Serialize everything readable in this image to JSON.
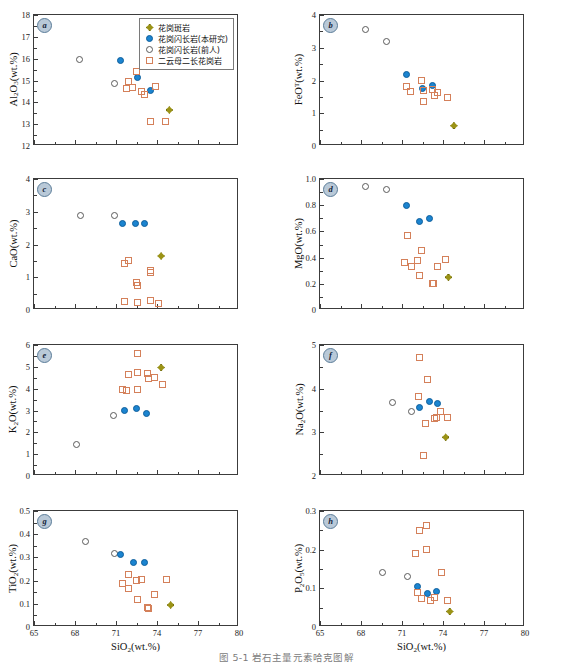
{
  "figure": {
    "caption": "图 5-1  岩石主量元素哈克图解",
    "xaxis": {
      "title_html": "SiO<sub>2</sub>(wt.%)",
      "ticks": [
        65,
        68,
        71,
        74,
        77,
        80
      ],
      "min": 65,
      "max": 80
    }
  },
  "legend": {
    "position": "panel-a-top-right",
    "items": [
      {
        "marker": "dia-fill",
        "marker_name": "diamond-filled-olive",
        "label": "花岗斑岩",
        "color": "#9b9316"
      },
      {
        "marker": "circ-fill",
        "marker_name": "circle-filled-blue",
        "label": "花岗闪长岩(本研究)",
        "color": "#1b84d0"
      },
      {
        "marker": "circ-open",
        "marker_name": "circle-open-gray",
        "label": "花岗闪长岩(前人)",
        "color": "#5a5a5a"
      },
      {
        "marker": "sq-open",
        "marker_name": "square-open-orange",
        "label": "二云母二长花岗岩",
        "color": "#d4805a"
      }
    ]
  },
  "chart_data": [
    {
      "panel": "a",
      "type": "scatter",
      "title": "",
      "xlabel": "SiO2(wt.%)",
      "ylabel": "Al2O3(wt.%)",
      "ylabel_html": "Al<sub>2</sub>O<sub>3</sub>(wt.%)",
      "xlim": [
        65,
        80
      ],
      "ylim": [
        12,
        18
      ],
      "yticks": [
        12,
        13,
        14,
        15,
        16,
        17,
        18
      ],
      "grid": false,
      "series": [
        {
          "name": "花岗闪长岩(前人)",
          "marker": "circ-open",
          "points": [
            [
              68.3,
              15.95
            ],
            [
              70.9,
              14.85
            ]
          ]
        },
        {
          "name": "花岗闪长岩(本研究)",
          "marker": "circ-fill",
          "points": [
            [
              71.3,
              15.92
            ],
            [
              72.6,
              15.13
            ],
            [
              73.5,
              14.52
            ]
          ]
        },
        {
          "name": "二云母二长花岗岩",
          "marker": "sq-open",
          "points": [
            [
              71.9,
              14.95
            ],
            [
              71.8,
              14.62
            ],
            [
              72.2,
              14.7
            ],
            [
              72.5,
              15.4
            ],
            [
              72.9,
              14.5
            ],
            [
              73.1,
              14.35
            ],
            [
              73.9,
              14.72
            ],
            [
              73.5,
              13.1
            ],
            [
              74.6,
              13.12
            ]
          ]
        },
        {
          "name": "花岗斑岩",
          "marker": "dia-fill",
          "points": [
            [
              74.9,
              13.65
            ]
          ]
        }
      ]
    },
    {
      "panel": "b",
      "type": "scatter",
      "xlabel": "SiO2(wt.%)",
      "ylabel": "FeOT(wt.%)",
      "ylabel_html": "FeO<sup>T</sup>(wt.%)",
      "xlim": [
        65,
        80
      ],
      "ylim": [
        0,
        4
      ],
      "yticks": [
        0,
        1,
        2,
        3,
        4
      ],
      "grid": false,
      "series": [
        {
          "name": "花岗闪长岩(前人)",
          "marker": "circ-open",
          "points": [
            [
              68.3,
              3.57
            ],
            [
              69.9,
              3.2
            ]
          ]
        },
        {
          "name": "花岗闪长岩(本研究)",
          "marker": "circ-fill",
          "points": [
            [
              71.3,
              2.17
            ],
            [
              72.5,
              1.76
            ],
            [
              73.2,
              1.84
            ]
          ]
        },
        {
          "name": "二云母二长花岗岩",
          "marker": "sq-open",
          "points": [
            [
              71.3,
              1.82
            ],
            [
              71.6,
              1.65
            ],
            [
              72.4,
              2.0
            ],
            [
              72.6,
              1.68
            ],
            [
              72.6,
              1.36
            ],
            [
              73.2,
              1.72
            ],
            [
              73.4,
              1.53
            ],
            [
              73.6,
              1.62
            ],
            [
              74.3,
              1.48
            ]
          ]
        },
        {
          "name": "花岗斑岩",
          "marker": "dia-fill",
          "points": [
            [
              74.8,
              0.62
            ]
          ]
        }
      ]
    },
    {
      "panel": "c",
      "type": "scatter",
      "xlabel": "SiO2(wt.%)",
      "ylabel": "CaO(wt.%)",
      "ylabel_html": "CaO(wt.%)",
      "xlim": [
        65,
        80
      ],
      "ylim": [
        0,
        4
      ],
      "yticks": [
        0,
        1,
        2,
        3,
        4
      ],
      "grid": false,
      "series": [
        {
          "name": "花岗闪长岩(前人)",
          "marker": "circ-open",
          "points": [
            [
              68.4,
              2.88
            ],
            [
              70.9,
              2.9
            ]
          ]
        },
        {
          "name": "花岗闪长岩(本研究)",
          "marker": "circ-fill",
          "points": [
            [
              71.5,
              2.65
            ],
            [
              72.4,
              2.64
            ],
            [
              73.1,
              2.64
            ]
          ]
        },
        {
          "name": "二云母二长花岗岩",
          "marker": "sq-open",
          "points": [
            [
              71.6,
              1.42
            ],
            [
              71.9,
              1.5
            ],
            [
              72.5,
              0.85
            ],
            [
              72.6,
              0.75
            ],
            [
              73.5,
              1.2
            ],
            [
              73.5,
              1.15
            ],
            [
              71.6,
              0.26
            ],
            [
              72.6,
              0.22
            ],
            [
              73.5,
              0.3
            ],
            [
              74.1,
              0.2
            ]
          ]
        },
        {
          "name": "花岗斑岩",
          "marker": "dia-fill",
          "points": [
            [
              74.3,
              1.65
            ]
          ]
        }
      ]
    },
    {
      "panel": "d",
      "type": "scatter",
      "xlabel": "SiO2(wt.%)",
      "ylabel": "MgO(wt.%)",
      "ylabel_html": "MgO(wt.%)",
      "xlim": [
        65,
        80
      ],
      "ylim": [
        0,
        1.0
      ],
      "yticks": [
        0,
        0.2,
        0.4,
        0.6,
        0.8,
        1.0
      ],
      "ytick_labels": [
        "0",
        "0.2",
        "0.4",
        "0.6",
        "0.8",
        "1.0"
      ],
      "grid": false,
      "series": [
        {
          "name": "花岗闪长岩(前人)",
          "marker": "circ-open",
          "points": [
            [
              68.3,
              0.94
            ],
            [
              69.9,
              0.92
            ]
          ]
        },
        {
          "name": "花岗闪长岩(本研究)",
          "marker": "circ-fill",
          "points": [
            [
              71.3,
              0.795
            ],
            [
              72.3,
              0.675
            ],
            [
              73.0,
              0.7
            ]
          ]
        },
        {
          "name": "二云母二长花岗岩",
          "marker": "sq-open",
          "points": [
            [
              71.4,
              0.57
            ],
            [
              71.2,
              0.365
            ],
            [
              71.7,
              0.33
            ],
            [
              72.1,
              0.375
            ],
            [
              72.4,
              0.455
            ],
            [
              72.3,
              0.265
            ],
            [
              73.2,
              0.2
            ],
            [
              73.3,
              0.205
            ],
            [
              73.6,
              0.335
            ],
            [
              74.2,
              0.385
            ]
          ]
        },
        {
          "name": "花岗斑岩",
          "marker": "dia-fill",
          "points": [
            [
              74.4,
              0.25
            ]
          ]
        }
      ]
    },
    {
      "panel": "e",
      "type": "scatter",
      "xlabel": "SiO2(wt.%)",
      "ylabel": "K2O(wt.%)",
      "ylabel_html": "K<sub>2</sub>O(wt.%)",
      "xlim": [
        65,
        80
      ],
      "ylim": [
        0,
        6
      ],
      "yticks": [
        0,
        1,
        2,
        3,
        4,
        5,
        6
      ],
      "grid": false,
      "series": [
        {
          "name": "花岗闪长岩(前人)",
          "marker": "circ-open",
          "points": [
            [
              68.1,
              1.45
            ],
            [
              70.8,
              2.78
            ]
          ]
        },
        {
          "name": "花岗闪长岩(本研究)",
          "marker": "circ-fill",
          "points": [
            [
              71.6,
              3.02
            ],
            [
              72.5,
              3.1
            ],
            [
              73.2,
              2.88
            ]
          ]
        },
        {
          "name": "二云母二长花岗岩",
          "marker": "sq-open",
          "points": [
            [
              72.6,
              5.62
            ],
            [
              71.9,
              4.65
            ],
            [
              72.6,
              4.75
            ],
            [
              71.5,
              3.96
            ],
            [
              71.8,
              3.92
            ],
            [
              72.6,
              3.97
            ],
            [
              73.3,
              4.68
            ],
            [
              73.4,
              4.48
            ],
            [
              73.8,
              4.5
            ],
            [
              74.4,
              4.2
            ]
          ]
        },
        {
          "name": "花岗斑岩",
          "marker": "dia-fill",
          "points": [
            [
              74.3,
              4.97
            ]
          ]
        }
      ]
    },
    {
      "panel": "f",
      "type": "scatter",
      "xlabel": "SiO2(wt.%)",
      "ylabel": "Na2O(wt.%)",
      "ylabel_html": "Na<sub>2</sub>O(wt.%)",
      "xlim": [
        65,
        80
      ],
      "ylim": [
        2,
        5
      ],
      "yticks": [
        2,
        3,
        4,
        5
      ],
      "grid": false,
      "series": [
        {
          "name": "花岗闪长岩(前人)",
          "marker": "circ-open",
          "points": [
            [
              70.3,
              3.68
            ],
            [
              71.7,
              3.47
            ]
          ]
        },
        {
          "name": "花岗闪长岩(本研究)",
          "marker": "circ-fill",
          "points": [
            [
              72.3,
              3.58
            ],
            [
              73.0,
              3.7
            ],
            [
              73.6,
              3.66
            ]
          ]
        },
        {
          "name": "二云母二长花岗岩",
          "marker": "sq-open",
          "points": [
            [
              72.3,
              4.72
            ],
            [
              72.9,
              4.2
            ],
            [
              72.2,
              3.82
            ],
            [
              72.7,
              3.2
            ],
            [
              73.4,
              3.32
            ],
            [
              73.5,
              3.35
            ],
            [
              73.8,
              3.47
            ],
            [
              74.3,
              3.35
            ],
            [
              72.6,
              2.48
            ]
          ]
        },
        {
          "name": "花岗斑岩",
          "marker": "dia-fill",
          "points": [
            [
              74.2,
              2.89
            ]
          ]
        }
      ]
    },
    {
      "panel": "g",
      "type": "scatter",
      "xlabel": "SiO2(wt.%)",
      "ylabel": "TiO2(wt.%)",
      "ylabel_html": "TiO<sub>2</sub>(wt.%)",
      "xlim": [
        65,
        80
      ],
      "ylim": [
        0,
        0.5
      ],
      "yticks": [
        0,
        0.1,
        0.2,
        0.3,
        0.4,
        0.5
      ],
      "ytick_labels": [
        "0",
        "0.1",
        "0.2",
        "0.3",
        "0.4",
        "0.5"
      ],
      "grid": false,
      "series": [
        {
          "name": "花岗闪长岩(前人)",
          "marker": "circ-open",
          "points": [
            [
              68.8,
              0.37
            ],
            [
              70.9,
              0.318
            ]
          ]
        },
        {
          "name": "花岗闪长岩(本研究)",
          "marker": "circ-fill",
          "points": [
            [
              71.3,
              0.311
            ],
            [
              72.3,
              0.278
            ],
            [
              73.1,
              0.276
            ]
          ]
        },
        {
          "name": "二云母二长花岗岩",
          "marker": "sq-open",
          "points": [
            [
              71.9,
              0.227
            ],
            [
              71.5,
              0.188
            ],
            [
              71.9,
              0.167
            ],
            [
              72.5,
              0.199
            ],
            [
              72.9,
              0.206
            ],
            [
              72.6,
              0.118
            ],
            [
              73.3,
              0.085
            ],
            [
              73.4,
              0.079
            ],
            [
              73.8,
              0.138
            ],
            [
              74.7,
              0.206
            ]
          ]
        },
        {
          "name": "花岗斑岩",
          "marker": "dia-fill",
          "points": [
            [
              75.0,
              0.095
            ]
          ]
        }
      ]
    },
    {
      "panel": "h",
      "type": "scatter",
      "xlabel": "SiO2(wt.%)",
      "ylabel": "P2O5(wt.%)",
      "ylabel_html": "P<sub>2</sub>O<sub>5</sub>(wt.%)",
      "xlim": [
        65,
        80
      ],
      "ylim": [
        0,
        0.3
      ],
      "yticks": [
        0,
        0.1,
        0.2,
        0.3
      ],
      "ytick_labels": [
        "0",
        "0.1",
        "0.2",
        "0.3"
      ],
      "grid": false,
      "series": [
        {
          "name": "花岗闪长岩(前人)",
          "marker": "circ-open",
          "points": [
            [
              69.6,
              0.142
            ],
            [
              71.4,
              0.131
            ]
          ]
        },
        {
          "name": "花岗闪长岩(本研究)",
          "marker": "circ-fill",
          "points": [
            [
              72.1,
              0.106
            ],
            [
              72.9,
              0.086
            ],
            [
              73.5,
              0.091
            ]
          ]
        },
        {
          "name": "二云母二长花岗岩",
          "marker": "sq-open",
          "points": [
            [
              72.3,
              0.25
            ],
            [
              72.8,
              0.262
            ],
            [
              72.0,
              0.19
            ],
            [
              72.8,
              0.2
            ],
            [
              73.9,
              0.142
            ],
            [
              72.1,
              0.09
            ],
            [
              72.4,
              0.073
            ],
            [
              73.1,
              0.069
            ],
            [
              73.4,
              0.077
            ],
            [
              74.3,
              0.069
            ]
          ]
        },
        {
          "name": "花岗斑岩",
          "marker": "dia-fill",
          "points": [
            [
              74.5,
              0.04
            ]
          ]
        }
      ]
    }
  ]
}
